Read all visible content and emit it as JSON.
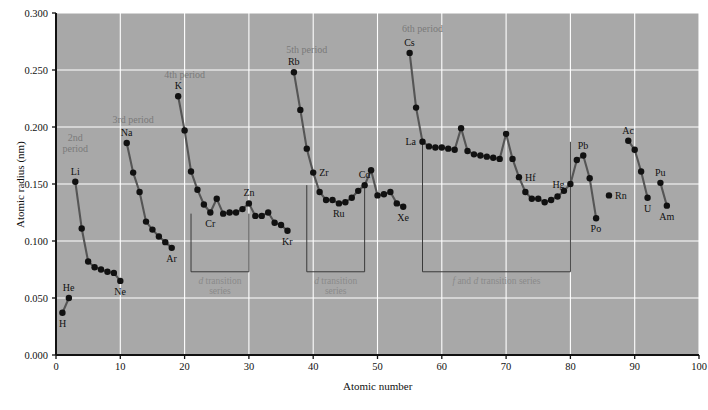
{
  "chart_data": {
    "type": "scatter",
    "title": "",
    "xlabel": "Atomic number",
    "ylabel": "Atomic radius (nm)",
    "xlim": [
      0,
      100
    ],
    "ylim": [
      0.0,
      0.3
    ],
    "xticks": [
      "0",
      "10",
      "20",
      "30",
      "40",
      "50",
      "60",
      "70",
      "80",
      "90",
      "100"
    ],
    "xtick_values": [
      0,
      10,
      20,
      30,
      40,
      50,
      60,
      70,
      80,
      90,
      100
    ],
    "yticks": [
      "0.000",
      "0.050",
      "0.100",
      "0.150",
      "0.200",
      "0.250",
      "0.300"
    ],
    "ytick_values": [
      0.0,
      0.05,
      0.1,
      0.15,
      0.2,
      0.25,
      0.3
    ],
    "grid": true,
    "legend": "none",
    "plot_bgcolor": "#a8a8a8",
    "gridline_color": "#ffffff",
    "line_color": "#555555",
    "marker_color": "#111111",
    "annotation_color": "#7a7a7a",
    "series": [
      {
        "name": "Period 1",
        "points": [
          {
            "x": 1,
            "y": 0.037,
            "label": "H",
            "label_pos": "below"
          },
          {
            "x": 2,
            "y": 0.05,
            "label": "He",
            "label_pos": "above"
          }
        ]
      },
      {
        "name": "Period 2",
        "points": [
          {
            "x": 3,
            "y": 0.152,
            "label": "Li",
            "label_pos": "above"
          },
          {
            "x": 4,
            "y": 0.111,
            "label": "",
            "label_pos": ""
          },
          {
            "x": 5,
            "y": 0.082,
            "label": "",
            "label_pos": ""
          },
          {
            "x": 6,
            "y": 0.077,
            "label": "",
            "label_pos": ""
          },
          {
            "x": 7,
            "y": 0.075,
            "label": "",
            "label_pos": ""
          },
          {
            "x": 8,
            "y": 0.073,
            "label": "",
            "label_pos": ""
          },
          {
            "x": 9,
            "y": 0.072,
            "label": "",
            "label_pos": ""
          },
          {
            "x": 10,
            "y": 0.065,
            "label": "Ne",
            "label_pos": "below"
          }
        ]
      },
      {
        "name": "Period 3",
        "points": [
          {
            "x": 11,
            "y": 0.186,
            "label": "Na",
            "label_pos": "above"
          },
          {
            "x": 12,
            "y": 0.16,
            "label": "",
            "label_pos": ""
          },
          {
            "x": 13,
            "y": 0.143,
            "label": "",
            "label_pos": ""
          },
          {
            "x": 14,
            "y": 0.117,
            "label": "",
            "label_pos": ""
          },
          {
            "x": 15,
            "y": 0.11,
            "label": "",
            "label_pos": ""
          },
          {
            "x": 16,
            "y": 0.104,
            "label": "",
            "label_pos": ""
          },
          {
            "x": 17,
            "y": 0.099,
            "label": "",
            "label_pos": ""
          },
          {
            "x": 18,
            "y": 0.094,
            "label": "Ar",
            "label_pos": "below"
          }
        ]
      },
      {
        "name": "Period 4",
        "points": [
          {
            "x": 19,
            "y": 0.227,
            "label": "K",
            "label_pos": "above"
          },
          {
            "x": 20,
            "y": 0.197,
            "label": "",
            "label_pos": ""
          },
          {
            "x": 21,
            "y": 0.161,
            "label": "",
            "label_pos": ""
          },
          {
            "x": 22,
            "y": 0.145,
            "label": "",
            "label_pos": ""
          },
          {
            "x": 23,
            "y": 0.132,
            "label": "",
            "label_pos": ""
          },
          {
            "x": 24,
            "y": 0.125,
            "label": "Cr",
            "label_pos": "below"
          },
          {
            "x": 25,
            "y": 0.137,
            "label": "",
            "label_pos": ""
          },
          {
            "x": 26,
            "y": 0.124,
            "label": "",
            "label_pos": ""
          },
          {
            "x": 27,
            "y": 0.125,
            "label": "",
            "label_pos": ""
          },
          {
            "x": 28,
            "y": 0.125,
            "label": "",
            "label_pos": ""
          },
          {
            "x": 29,
            "y": 0.128,
            "label": "",
            "label_pos": ""
          },
          {
            "x": 30,
            "y": 0.133,
            "label": "Zn",
            "label_pos": "above"
          },
          {
            "x": 31,
            "y": 0.122,
            "label": "",
            "label_pos": ""
          },
          {
            "x": 32,
            "y": 0.122,
            "label": "",
            "label_pos": ""
          },
          {
            "x": 33,
            "y": 0.125,
            "label": "",
            "label_pos": ""
          },
          {
            "x": 34,
            "y": 0.116,
            "label": "",
            "label_pos": ""
          },
          {
            "x": 35,
            "y": 0.114,
            "label": "",
            "label_pos": ""
          },
          {
            "x": 36,
            "y": 0.109,
            "label": "Kr",
            "label_pos": "below"
          }
        ]
      },
      {
        "name": "Period 5",
        "points": [
          {
            "x": 37,
            "y": 0.248,
            "label": "Rb",
            "label_pos": "above"
          },
          {
            "x": 38,
            "y": 0.215,
            "label": "",
            "label_pos": ""
          },
          {
            "x": 39,
            "y": 0.181,
            "label": "",
            "label_pos": ""
          },
          {
            "x": 40,
            "y": 0.16,
            "label": "Zr",
            "label_pos": "right"
          },
          {
            "x": 41,
            "y": 0.143,
            "label": "",
            "label_pos": ""
          },
          {
            "x": 42,
            "y": 0.136,
            "label": "",
            "label_pos": ""
          },
          {
            "x": 43,
            "y": 0.136,
            "label": "",
            "label_pos": ""
          },
          {
            "x": 44,
            "y": 0.133,
            "label": "Ru",
            "label_pos": "below"
          },
          {
            "x": 45,
            "y": 0.134,
            "label": "",
            "label_pos": ""
          },
          {
            "x": 46,
            "y": 0.138,
            "label": "",
            "label_pos": ""
          },
          {
            "x": 47,
            "y": 0.144,
            "label": "",
            "label_pos": ""
          },
          {
            "x": 48,
            "y": 0.149,
            "label": "Cd",
            "label_pos": "above"
          },
          {
            "x": 49,
            "y": 0.162,
            "label": "",
            "label_pos": ""
          },
          {
            "x": 50,
            "y": 0.14,
            "label": "",
            "label_pos": ""
          },
          {
            "x": 51,
            "y": 0.141,
            "label": "",
            "label_pos": ""
          },
          {
            "x": 52,
            "y": 0.143,
            "label": "",
            "label_pos": ""
          },
          {
            "x": 53,
            "y": 0.133,
            "label": "",
            "label_pos": ""
          },
          {
            "x": 54,
            "y": 0.13,
            "label": "Xe",
            "label_pos": "below"
          }
        ]
      },
      {
        "name": "Period 6",
        "points": [
          {
            "x": 55,
            "y": 0.265,
            "label": "Cs",
            "label_pos": "above"
          },
          {
            "x": 56,
            "y": 0.217,
            "label": "",
            "label_pos": ""
          },
          {
            "x": 57,
            "y": 0.187,
            "label": "La",
            "label_pos": "left"
          },
          {
            "x": 58,
            "y": 0.183,
            "label": "",
            "label_pos": ""
          },
          {
            "x": 59,
            "y": 0.182,
            "label": "",
            "label_pos": ""
          },
          {
            "x": 60,
            "y": 0.182,
            "label": "",
            "label_pos": ""
          },
          {
            "x": 61,
            "y": 0.181,
            "label": "",
            "label_pos": ""
          },
          {
            "x": 62,
            "y": 0.18,
            "label": "",
            "label_pos": ""
          },
          {
            "x": 63,
            "y": 0.199,
            "label": "",
            "label_pos": ""
          },
          {
            "x": 64,
            "y": 0.179,
            "label": "",
            "label_pos": ""
          },
          {
            "x": 65,
            "y": 0.176,
            "label": "",
            "label_pos": ""
          },
          {
            "x": 66,
            "y": 0.175,
            "label": "",
            "label_pos": ""
          },
          {
            "x": 67,
            "y": 0.174,
            "label": "",
            "label_pos": ""
          },
          {
            "x": 68,
            "y": 0.173,
            "label": "",
            "label_pos": ""
          },
          {
            "x": 69,
            "y": 0.172,
            "label": "",
            "label_pos": ""
          },
          {
            "x": 70,
            "y": 0.194,
            "label": "",
            "label_pos": ""
          },
          {
            "x": 71,
            "y": 0.172,
            "label": "",
            "label_pos": ""
          },
          {
            "x": 72,
            "y": 0.156,
            "label": "Hf",
            "label_pos": "right"
          },
          {
            "x": 73,
            "y": 0.143,
            "label": "",
            "label_pos": ""
          },
          {
            "x": 74,
            "y": 0.137,
            "label": "",
            "label_pos": ""
          },
          {
            "x": 75,
            "y": 0.137,
            "label": "",
            "label_pos": ""
          },
          {
            "x": 76,
            "y": 0.134,
            "label": "",
            "label_pos": ""
          },
          {
            "x": 77,
            "y": 0.136,
            "label": "",
            "label_pos": ""
          },
          {
            "x": 78,
            "y": 0.139,
            "label": "",
            "label_pos": ""
          },
          {
            "x": 79,
            "y": 0.144,
            "label": "",
            "label_pos": ""
          },
          {
            "x": 80,
            "y": 0.15,
            "label": "Hg",
            "label_pos": "left"
          },
          {
            "x": 81,
            "y": 0.171,
            "label": "",
            "label_pos": ""
          },
          {
            "x": 82,
            "y": 0.175,
            "label": "Pb",
            "label_pos": "above"
          },
          {
            "x": 83,
            "y": 0.155,
            "label": "",
            "label_pos": ""
          },
          {
            "x": 84,
            "y": 0.12,
            "label": "Po",
            "label_pos": "below"
          }
        ]
      },
      {
        "name": "Radon",
        "points": [
          {
            "x": 86,
            "y": 0.14,
            "label": "Rn",
            "label_pos": "right"
          }
        ]
      },
      {
        "name": "Period 7",
        "points": [
          {
            "x": 89,
            "y": 0.188,
            "label": "Ac",
            "label_pos": "above"
          },
          {
            "x": 90,
            "y": 0.18,
            "label": "",
            "label_pos": ""
          },
          {
            "x": 91,
            "y": 0.161,
            "label": "",
            "label_pos": ""
          },
          {
            "x": 92,
            "y": 0.138,
            "label": "U",
            "label_pos": "below"
          }
        ]
      },
      {
        "name": "Period 7b",
        "points": [
          {
            "x": 94,
            "y": 0.151,
            "label": "Pu",
            "label_pos": "above"
          },
          {
            "x": 95,
            "y": 0.131,
            "label": "Am",
            "label_pos": "below"
          }
        ]
      }
    ],
    "period_annotations": [
      {
        "text_line1": "2nd",
        "text_line2": "period",
        "x": 3,
        "y": 0.176
      },
      {
        "text_line1": "3rd period",
        "text_line2": "",
        "x": 12,
        "y": 0.201
      },
      {
        "text_line1": "4th period",
        "text_line2": "",
        "x": 20,
        "y": 0.24
      },
      {
        "text_line1": "5th period",
        "text_line2": "",
        "x": 39,
        "y": 0.262
      },
      {
        "text_line1": "6th period",
        "text_line2": "",
        "x": 57,
        "y": 0.281
      }
    ],
    "bracket_annotations": [
      {
        "label_italic": "d",
        "label_rest": " transition",
        "label_line2": "series",
        "x_start": 21,
        "x_end": 30,
        "y_bottom": 0.073,
        "y_top": 0.124
      },
      {
        "label_italic": "d",
        "label_rest": " transition",
        "label_line2": "series",
        "x_start": 39,
        "x_end": 48,
        "y_bottom": 0.073,
        "y_top": 0.149
      },
      {
        "label_italic": "f",
        "label_rest": " and ",
        "label_italic2": "d",
        "label_rest2": " transition series",
        "label_line2": "",
        "x_start": 57,
        "x_end": 80,
        "y_bottom": 0.073,
        "y_top": 0.187
      }
    ]
  }
}
